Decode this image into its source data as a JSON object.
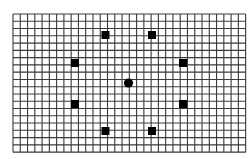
{
  "figure": {
    "background_color": "#ffffff",
    "grid": {
      "left": 13,
      "top": 14,
      "columns": 32,
      "rows": 19,
      "cell_size": 7.27,
      "line_color": "#3a3a3a",
      "line_width": 1.1
    },
    "fixation": {
      "shape": "circle",
      "cx": 128.5,
      "cy": 83,
      "r": 4.6,
      "color": "#000000"
    },
    "targets": {
      "shape": "square",
      "size": 8,
      "color": "#000000",
      "items": [
        {
          "id": "top-left",
          "cx": 105.5,
          "cy": 35
        },
        {
          "id": "top-right",
          "cx": 152,
          "cy": 35
        },
        {
          "id": "upper-right",
          "cx": 183,
          "cy": 63
        },
        {
          "id": "lower-right",
          "cx": 183,
          "cy": 104
        },
        {
          "id": "bottom-right",
          "cx": 152,
          "cy": 131
        },
        {
          "id": "bottom-left",
          "cx": 105.5,
          "cy": 131
        },
        {
          "id": "lower-left",
          "cx": 75,
          "cy": 104
        },
        {
          "id": "upper-left",
          "cx": 75,
          "cy": 63
        }
      ]
    }
  }
}
